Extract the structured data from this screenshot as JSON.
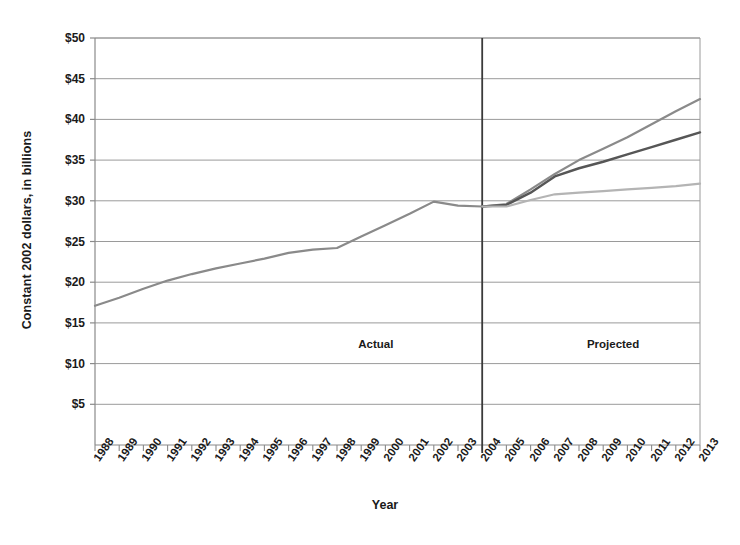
{
  "chart_data": {
    "type": "line",
    "title": "",
    "subtitle": "",
    "xlabel": "Year",
    "ylabel": "Constant 2002 dollars, in billions",
    "ylim": [
      0,
      50
    ],
    "ytick_values": [
      5,
      10,
      15,
      20,
      25,
      30,
      35,
      40,
      45,
      50
    ],
    "ytick_labels": [
      "$5",
      "$10",
      "$15",
      "$20",
      "$25",
      "$30",
      "$35",
      "$40",
      "$45",
      "$50"
    ],
    "grid": true,
    "legend": "none",
    "x": [
      1988,
      1989,
      1990,
      1991,
      1992,
      1993,
      1994,
      1995,
      1996,
      1997,
      1998,
      1999,
      2000,
      2001,
      2002,
      2003,
      2004,
      2005,
      2006,
      2007,
      2008,
      2009,
      2010,
      2011,
      2012,
      2013
    ],
    "xtick_labels": [
      "1988",
      "1989",
      "1990",
      "1991",
      "1992",
      "1993",
      "1994",
      "1995",
      "1996",
      "1997",
      "1998",
      "1999",
      "2000",
      "2001",
      "2002",
      "2003",
      "2004",
      "2005",
      "2006",
      "2007",
      "2008",
      "2009",
      "2010",
      "2011",
      "2012",
      "2013"
    ],
    "series": [
      {
        "name": "actual",
        "color": "#8a8a8a",
        "width": 2.2,
        "x": [
          1988,
          1989,
          1990,
          1991,
          1992,
          1993,
          1994,
          1995,
          1996,
          1997,
          1998,
          1999,
          2000,
          2001,
          2002,
          2003,
          2004
        ],
        "values": [
          17.1,
          18.1,
          19.2,
          20.2,
          21.0,
          21.7,
          22.3,
          22.9,
          23.6,
          24.0,
          24.2,
          25.6,
          27.0,
          28.4,
          29.9,
          29.4,
          29.3
        ]
      },
      {
        "name": "projected-high",
        "color": "#8a8a8a",
        "width": 2.2,
        "x": [
          2004,
          2005,
          2006,
          2007,
          2008,
          2009,
          2010,
          2011,
          2012,
          2013
        ],
        "values": [
          29.3,
          29.6,
          31.4,
          33.3,
          35.0,
          36.4,
          37.8,
          39.4,
          41.0,
          42.5
        ]
      },
      {
        "name": "projected-middle",
        "color": "#565656",
        "width": 2.4,
        "x": [
          2004,
          2005,
          2006,
          2007,
          2008,
          2009,
          2010,
          2011,
          2012,
          2013
        ],
        "values": [
          29.3,
          29.5,
          31.0,
          33.0,
          34.0,
          34.8,
          35.7,
          36.6,
          37.5,
          38.4
        ]
      },
      {
        "name": "projected-low",
        "color": "#b4b4b4",
        "width": 2.2,
        "x": [
          2004,
          2005,
          2006,
          2007,
          2008,
          2009,
          2010,
          2011,
          2012,
          2013
        ],
        "values": [
          29.3,
          29.3,
          30.1,
          30.8,
          31.0,
          31.2,
          31.4,
          31.6,
          31.8,
          32.1
        ]
      }
    ],
    "annotations": [
      {
        "text": "Actual",
        "x": 1999.6,
        "y": 12.3
      },
      {
        "text": "Projected",
        "x": 2009.4,
        "y": 12.3
      }
    ],
    "divider": {
      "x": 2004,
      "color": "#3a3a3a"
    },
    "colors": {
      "grid": "#9a9a9a",
      "axis": "#8a8a8a",
      "text": "#1a1a1a",
      "background": "#ffffff"
    }
  }
}
